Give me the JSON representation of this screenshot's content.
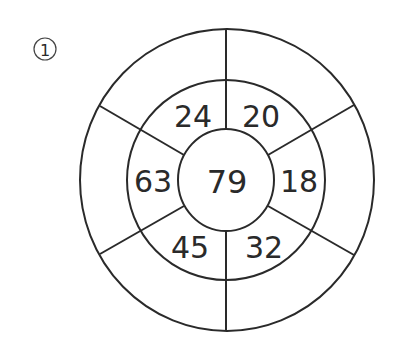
{
  "problem": {
    "label": "1",
    "colors": {
      "stroke": "#2a2a2a",
      "background": "#ffffff"
    }
  },
  "diagram": {
    "center": {
      "value": "79"
    },
    "middle_ring": [
      {
        "position": "top-left",
        "value": "24"
      },
      {
        "position": "top-right",
        "value": "20"
      },
      {
        "position": "right",
        "value": "18"
      },
      {
        "position": "bottom-right",
        "value": "32"
      },
      {
        "position": "bottom-left",
        "value": "45"
      },
      {
        "position": "left",
        "value": "63"
      }
    ],
    "outer_ring": [
      {
        "position": "top-left",
        "value": ""
      },
      {
        "position": "top-right",
        "value": ""
      },
      {
        "position": "right",
        "value": ""
      },
      {
        "position": "bottom-right",
        "value": ""
      },
      {
        "position": "bottom-left",
        "value": ""
      },
      {
        "position": "left",
        "value": ""
      }
    ]
  }
}
